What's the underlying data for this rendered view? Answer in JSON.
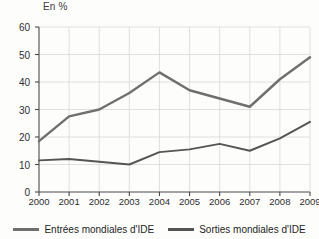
{
  "chart_data": {
    "type": "line",
    "title": "",
    "subtitle": "",
    "unit_label": "En %",
    "xlabel": "",
    "ylabel": "",
    "categories": [
      "2000",
      "2001",
      "2002",
      "2003",
      "2004",
      "2005",
      "2006",
      "2007",
      "2008",
      "2009"
    ],
    "x": [
      2000,
      2001,
      2002,
      2003,
      2004,
      2005,
      2006,
      2007,
      2008,
      2009
    ],
    "ylim": [
      0,
      60
    ],
    "yticks": [
      0,
      10,
      20,
      30,
      40,
      50,
      60
    ],
    "ytick_labels": [
      "0",
      "10",
      "20",
      "30",
      "40",
      "50",
      "60"
    ],
    "grid": true,
    "legend_position": "bottom",
    "series": [
      {
        "name": "Entrées mondiales d'IDE",
        "color": "#6f6f6f",
        "values": [
          18.5,
          27.5,
          30.0,
          36.0,
          43.5,
          37.0,
          34.0,
          31.0,
          41.0,
          49.0
        ]
      },
      {
        "name": "Sorties mondiales d'IDE",
        "color": "#555555",
        "values": [
          11.5,
          12.0,
          11.0,
          10.0,
          14.5,
          15.5,
          17.5,
          15.0,
          19.5,
          25.5
        ]
      }
    ]
  },
  "legend": {
    "items": [
      {
        "label": "Entrées mondiales d'IDE"
      },
      {
        "label": "Sorties mondiales d'IDE"
      }
    ]
  },
  "colors": {
    "axis": "#4a4a4a",
    "grid": "#d8d8d8",
    "series_entrees": "#6f6f6f",
    "series_sorties": "#555555",
    "text": "#2e2e2e",
    "background": "#fdfdfc"
  }
}
